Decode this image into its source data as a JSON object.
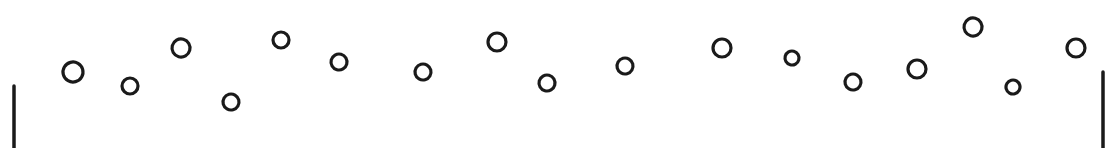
{
  "diagram": {
    "title": "",
    "stroke_color": "#1a1a1a",
    "background": "#ffffff",
    "walls": [
      {
        "id": "left-wall",
        "x": 14,
        "y1": 86,
        "y2": 148
      },
      {
        "id": "right-wall",
        "x": 1103,
        "y1": 72,
        "y2": 148
      }
    ],
    "bubbles": [
      {
        "cx": 73,
        "cy": 72,
        "rx": 11,
        "ry": 11
      },
      {
        "cx": 130,
        "cy": 86,
        "rx": 9,
        "ry": 9
      },
      {
        "cx": 181,
        "cy": 48,
        "rx": 10,
        "ry": 10
      },
      {
        "cx": 231,
        "cy": 102,
        "rx": 9,
        "ry": 9
      },
      {
        "cx": 281,
        "cy": 40,
        "rx": 9,
        "ry": 9
      },
      {
        "cx": 339,
        "cy": 62,
        "rx": 9,
        "ry": 9
      },
      {
        "cx": 423,
        "cy": 72,
        "rx": 9,
        "ry": 9
      },
      {
        "cx": 497,
        "cy": 42,
        "rx": 10,
        "ry": 10
      },
      {
        "cx": 547,
        "cy": 83,
        "rx": 9,
        "ry": 9
      },
      {
        "cx": 625,
        "cy": 66,
        "rx": 9,
        "ry": 9
      },
      {
        "cx": 722,
        "cy": 48,
        "rx": 10,
        "ry": 10
      },
      {
        "cx": 792,
        "cy": 58,
        "rx": 8,
        "ry": 8
      },
      {
        "cx": 853,
        "cy": 82,
        "rx": 9,
        "ry": 9
      },
      {
        "cx": 917,
        "cy": 69,
        "rx": 10,
        "ry": 10
      },
      {
        "cx": 973,
        "cy": 27,
        "rx": 10,
        "ry": 10
      },
      {
        "cx": 1013,
        "cy": 87,
        "rx": 8,
        "ry": 8
      },
      {
        "cx": 1076,
        "cy": 48,
        "rx": 10,
        "ry": 10
      }
    ]
  }
}
